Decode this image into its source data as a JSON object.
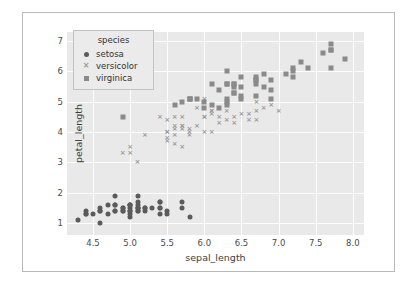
{
  "chart_data": {
    "type": "scatter",
    "title": "",
    "xlabel": "sepal_length",
    "ylabel": "petal_length",
    "xlim": [
      4.15,
      8.15
    ],
    "ylim": [
      0.6,
      7.3
    ],
    "xticks": [
      "4.5",
      "5.0",
      "5.5",
      "6.0",
      "6.5",
      "7.0",
      "7.5",
      "8.0"
    ],
    "xtick_values": [
      4.5,
      5.0,
      5.5,
      6.0,
      6.5,
      7.0,
      7.5,
      8.0
    ],
    "yticks": [
      "1",
      "2",
      "3",
      "4",
      "5",
      "6",
      "7"
    ],
    "ytick_values": [
      1,
      2,
      3,
      4,
      5,
      6,
      7
    ],
    "grid": true,
    "legend": {
      "title": "species",
      "position": "upper-left",
      "entries": [
        {
          "label": "setosa",
          "marker": "circle",
          "color": "#5b5b5b"
        },
        {
          "label": "versicolor",
          "marker": "x",
          "color": "#9a9a9a"
        },
        {
          "label": "virginica",
          "marker": "square",
          "color": "#8a8a8a"
        }
      ]
    },
    "series": [
      {
        "name": "setosa",
        "marker": "circle",
        "color": "#5b5b5b",
        "points": [
          [
            5.1,
            1.4
          ],
          [
            4.9,
            1.4
          ],
          [
            4.7,
            1.3
          ],
          [
            4.6,
            1.5
          ],
          [
            5.0,
            1.4
          ],
          [
            5.4,
            1.7
          ],
          [
            4.6,
            1.4
          ],
          [
            5.0,
            1.5
          ],
          [
            4.4,
            1.4
          ],
          [
            4.9,
            1.5
          ],
          [
            5.4,
            1.5
          ],
          [
            4.8,
            1.6
          ],
          [
            4.8,
            1.4
          ],
          [
            4.3,
            1.1
          ],
          [
            5.8,
            1.2
          ],
          [
            5.7,
            1.5
          ],
          [
            5.4,
            1.3
          ],
          [
            5.1,
            1.4
          ],
          [
            5.7,
            1.7
          ],
          [
            5.1,
            1.5
          ],
          [
            5.4,
            1.7
          ],
          [
            5.1,
            1.5
          ],
          [
            4.6,
            1.0
          ],
          [
            5.1,
            1.7
          ],
          [
            4.8,
            1.9
          ],
          [
            5.0,
            1.6
          ],
          [
            5.0,
            1.6
          ],
          [
            5.2,
            1.5
          ],
          [
            5.2,
            1.4
          ],
          [
            4.7,
            1.6
          ],
          [
            4.8,
            1.6
          ],
          [
            5.4,
            1.5
          ],
          [
            5.2,
            1.5
          ],
          [
            5.5,
            1.4
          ],
          [
            4.9,
            1.5
          ],
          [
            5.0,
            1.2
          ],
          [
            5.5,
            1.3
          ],
          [
            4.9,
            1.4
          ],
          [
            4.4,
            1.3
          ],
          [
            5.1,
            1.5
          ],
          [
            5.0,
            1.3
          ],
          [
            4.5,
            1.3
          ],
          [
            4.4,
            1.3
          ],
          [
            5.0,
            1.6
          ],
          [
            5.1,
            1.9
          ],
          [
            4.8,
            1.4
          ],
          [
            5.1,
            1.6
          ],
          [
            4.6,
            1.4
          ],
          [
            5.3,
            1.5
          ],
          [
            5.0,
            1.4
          ]
        ]
      },
      {
        "name": "versicolor",
        "marker": "x",
        "color": "#9a9a9a",
        "points": [
          [
            7.0,
            4.7
          ],
          [
            6.4,
            4.5
          ],
          [
            6.9,
            4.9
          ],
          [
            5.5,
            4.0
          ],
          [
            6.5,
            4.6
          ],
          [
            5.7,
            4.5
          ],
          [
            6.3,
            4.7
          ],
          [
            4.9,
            3.3
          ],
          [
            6.6,
            4.6
          ],
          [
            5.2,
            3.9
          ],
          [
            5.0,
            3.5
          ],
          [
            5.9,
            4.2
          ],
          [
            6.0,
            4.0
          ],
          [
            6.1,
            4.7
          ],
          [
            5.6,
            3.6
          ],
          [
            6.7,
            4.4
          ],
          [
            5.6,
            4.5
          ],
          [
            5.8,
            4.1
          ],
          [
            6.2,
            4.5
          ],
          [
            5.6,
            3.9
          ],
          [
            5.9,
            4.8
          ],
          [
            6.1,
            4.0
          ],
          [
            6.3,
            4.9
          ],
          [
            6.1,
            4.7
          ],
          [
            6.4,
            4.3
          ],
          [
            6.6,
            4.4
          ],
          [
            6.8,
            4.8
          ],
          [
            6.7,
            5.0
          ],
          [
            6.0,
            4.5
          ],
          [
            5.7,
            3.5
          ],
          [
            5.5,
            3.8
          ],
          [
            5.5,
            3.7
          ],
          [
            5.8,
            3.9
          ],
          [
            6.0,
            5.1
          ],
          [
            5.4,
            4.5
          ],
          [
            6.0,
            4.5
          ],
          [
            6.7,
            4.7
          ],
          [
            6.3,
            4.4
          ],
          [
            5.6,
            4.1
          ],
          [
            5.5,
            4.0
          ],
          [
            5.5,
            4.4
          ],
          [
            6.1,
            4.6
          ],
          [
            5.8,
            4.0
          ],
          [
            5.0,
            3.3
          ],
          [
            5.6,
            4.2
          ],
          [
            5.7,
            4.2
          ],
          [
            5.7,
            4.2
          ],
          [
            6.2,
            4.3
          ],
          [
            5.1,
            3.0
          ],
          [
            5.7,
            4.1
          ]
        ]
      },
      {
        "name": "virginica",
        "marker": "square",
        "color": "#8a8a8a",
        "points": [
          [
            6.3,
            6.0
          ],
          [
            5.8,
            5.1
          ],
          [
            7.1,
            5.9
          ],
          [
            6.3,
            5.6
          ],
          [
            6.5,
            5.8
          ],
          [
            7.6,
            6.6
          ],
          [
            4.9,
            4.5
          ],
          [
            7.3,
            6.3
          ],
          [
            6.7,
            5.8
          ],
          [
            7.2,
            6.1
          ],
          [
            6.5,
            5.1
          ],
          [
            6.4,
            5.3
          ],
          [
            6.8,
            5.5
          ],
          [
            5.7,
            5.0
          ],
          [
            5.8,
            5.1
          ],
          [
            6.4,
            5.3
          ],
          [
            6.5,
            5.5
          ],
          [
            7.7,
            6.7
          ],
          [
            7.7,
            6.9
          ],
          [
            6.0,
            5.0
          ],
          [
            6.9,
            5.7
          ],
          [
            5.6,
            4.9
          ],
          [
            7.7,
            6.7
          ],
          [
            6.3,
            4.9
          ],
          [
            6.7,
            5.7
          ],
          [
            7.2,
            6.0
          ],
          [
            6.2,
            4.8
          ],
          [
            6.1,
            4.9
          ],
          [
            6.4,
            5.6
          ],
          [
            7.2,
            5.8
          ],
          [
            7.4,
            6.1
          ],
          [
            7.9,
            6.4
          ],
          [
            6.4,
            5.6
          ],
          [
            6.3,
            5.1
          ],
          [
            6.1,
            5.6
          ],
          [
            7.7,
            6.1
          ],
          [
            6.3,
            5.6
          ],
          [
            6.4,
            5.5
          ],
          [
            6.0,
            4.8
          ],
          [
            6.9,
            5.4
          ],
          [
            6.7,
            5.6
          ],
          [
            6.9,
            5.1
          ],
          [
            5.8,
            5.1
          ],
          [
            6.8,
            5.9
          ],
          [
            6.7,
            5.7
          ],
          [
            6.7,
            5.2
          ],
          [
            6.3,
            5.0
          ],
          [
            6.5,
            5.2
          ],
          [
            6.2,
            5.4
          ],
          [
            5.9,
            5.1
          ]
        ]
      }
    ]
  }
}
